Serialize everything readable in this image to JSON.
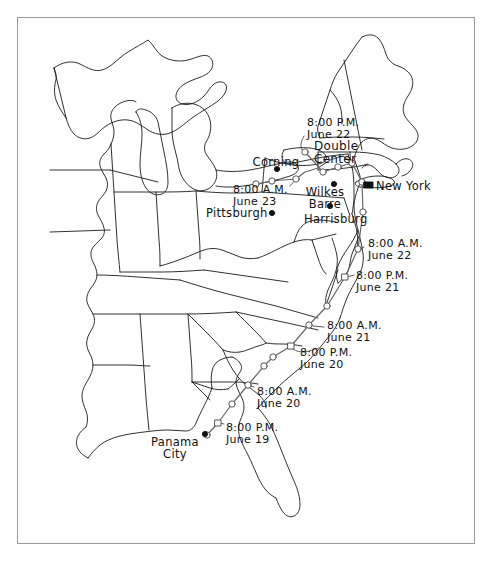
{
  "figure": {
    "type": "map",
    "background_color": "#ffffff",
    "line_color": "#1a1a1a",
    "frame_color": "#9a9a9a"
  },
  "cities": [
    {
      "name": "Corning",
      "dot": true,
      "dot_style": "filled",
      "x": 277,
      "y": 169,
      "label_x": 276,
      "label_y": 156,
      "label_align": "center"
    },
    {
      "name": "Wilkes\nBarre",
      "dot": true,
      "dot_style": "filled",
      "x": 334,
      "y": 184,
      "label_x": 325,
      "label_y": 186,
      "label_align": "center"
    },
    {
      "name": "New York",
      "dot": true,
      "dot_style": "square-filled",
      "x": 368,
      "y": 185,
      "label_x": 376,
      "label_y": 180,
      "label_align": "left"
    },
    {
      "name": "Pittsburgh",
      "dot": true,
      "dot_style": "filled",
      "x": 272,
      "y": 213,
      "label_x": 206,
      "label_y": 207,
      "label_align": "left"
    },
    {
      "name": "Harrisburg",
      "dot": true,
      "dot_style": "filled",
      "x": 330,
      "y": 206,
      "label_x": 304,
      "label_y": 213,
      "label_align": "left"
    },
    {
      "name": "Panama\nCity",
      "dot": true,
      "dot_style": "filled",
      "x": 205,
      "y": 434,
      "label_x": 175,
      "label_y": 436,
      "label_align": "center"
    }
  ],
  "annotations": [
    {
      "id": "double-center",
      "text": "Double\nCenter",
      "x": 314,
      "y": 140,
      "align": "left"
    }
  ],
  "track_times": [
    {
      "id": "t-june-22-pm",
      "time": "8:00 P.M.",
      "date": "June 22",
      "label_x": 307,
      "label_y": 117,
      "marker_x": 305,
      "marker_y": 152,
      "marker": "circle"
    },
    {
      "id": "t-june-23-am",
      "time": "8:00 A.M.",
      "date": "June 23",
      "label_x": 233,
      "label_y": 184,
      "marker_x": 296,
      "marker_y": 179,
      "marker": "circle"
    },
    {
      "id": "t-june-22-am",
      "time": "8:00 A.M.",
      "date": "June 22",
      "label_x": 368,
      "label_y": 238,
      "marker_x": 358,
      "marker_y": 249,
      "marker": "circle"
    },
    {
      "id": "t-june-21-pm",
      "time": "8:00 P.M.",
      "date": "June 21",
      "label_x": 356,
      "label_y": 270,
      "marker_x": 345,
      "marker_y": 277,
      "marker": "square"
    },
    {
      "id": "t-june-21-am",
      "time": "8:00 A.M.",
      "date": "June 21",
      "label_x": 327,
      "label_y": 320,
      "marker_x": 309,
      "marker_y": 325,
      "marker": "circle"
    },
    {
      "id": "t-june-20-pm",
      "time": "8:00 P.M.",
      "date": "June 20",
      "label_x": 300,
      "label_y": 347,
      "marker_x": 291,
      "marker_y": 346,
      "marker": "square"
    },
    {
      "id": "t-june-20-am",
      "time": "8:00 A.M.",
      "date": "June 20",
      "label_x": 257,
      "label_y": 386,
      "marker_x": 248,
      "marker_y": 385,
      "marker": "circle"
    },
    {
      "id": "t-june-19-pm",
      "time": "8:00 P.M.",
      "date": "June 19",
      "label_x": 226,
      "label_y": 422,
      "marker_x": 218,
      "marker_y": 423,
      "marker": "square"
    }
  ],
  "track_markers": [
    {
      "x": 207,
      "y": 435,
      "shape": "circle"
    },
    {
      "x": 218,
      "y": 423,
      "shape": "square"
    },
    {
      "x": 232,
      "y": 404,
      "shape": "circle"
    },
    {
      "x": 248,
      "y": 385,
      "shape": "circle"
    },
    {
      "x": 264,
      "y": 366,
      "shape": "circle"
    },
    {
      "x": 273,
      "y": 357,
      "shape": "circle"
    },
    {
      "x": 291,
      "y": 346,
      "shape": "square"
    },
    {
      "x": 309,
      "y": 325,
      "shape": "circle"
    },
    {
      "x": 327,
      "y": 306,
      "shape": "circle"
    },
    {
      "x": 345,
      "y": 277,
      "shape": "square"
    },
    {
      "x": 358,
      "y": 249,
      "shape": "circle"
    },
    {
      "x": 363,
      "y": 212,
      "shape": "circle"
    },
    {
      "x": 362,
      "y": 182,
      "shape": "circle"
    },
    {
      "x": 352,
      "y": 163,
      "shape": "circle"
    },
    {
      "x": 338,
      "y": 167,
      "shape": "circle"
    },
    {
      "x": 323,
      "y": 172,
      "shape": "circle"
    },
    {
      "x": 305,
      "y": 152,
      "shape": "circle"
    },
    {
      "x": 296,
      "y": 179,
      "shape": "circle"
    },
    {
      "x": 272,
      "y": 181,
      "shape": "circle"
    },
    {
      "x": 256,
      "y": 184,
      "shape": "circle"
    }
  ]
}
